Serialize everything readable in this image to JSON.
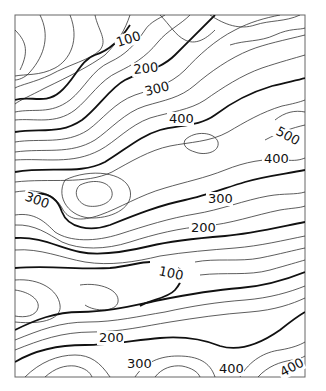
{
  "map": {
    "type": "topographic contour map",
    "contour_interval_minor": 20,
    "contour_interval_major": 100,
    "labels": [
      {
        "text": "100",
        "x": 118,
        "y": 47,
        "rotate": -18
      },
      {
        "text": "200",
        "x": 134,
        "y": 74,
        "rotate": -6
      },
      {
        "text": "300",
        "x": 146,
        "y": 96,
        "rotate": -14
      },
      {
        "text": "400",
        "x": 169,
        "y": 123,
        "rotate": 0
      },
      {
        "text": "500",
        "x": 275,
        "y": 134,
        "rotate": 28
      },
      {
        "text": "400",
        "x": 264,
        "y": 163,
        "rotate": 0
      },
      {
        "text": "300",
        "x": 24,
        "y": 200,
        "rotate": 20
      },
      {
        "text": "300",
        "x": 208,
        "y": 203,
        "rotate": 0
      },
      {
        "text": "200",
        "x": 191,
        "y": 232,
        "rotate": 0
      },
      {
        "text": "100",
        "x": 158,
        "y": 275,
        "rotate": 12
      },
      {
        "text": "200",
        "x": 99,
        "y": 342,
        "rotate": 0
      },
      {
        "text": "300",
        "x": 127,
        "y": 368,
        "rotate": 0
      },
      {
        "text": "400",
        "x": 219,
        "y": 373,
        "rotate": 0
      },
      {
        "text": "400",
        "x": 283,
        "y": 377,
        "rotate": -28
      }
    ],
    "frame": {
      "x": 15,
      "y": 15,
      "width": 290,
      "height": 362
    }
  }
}
